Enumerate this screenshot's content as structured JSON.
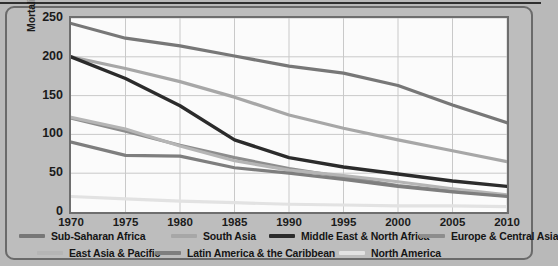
{
  "figure": {
    "background_color": "#b9b9b9",
    "panel_color": "#bdbdbd",
    "panel_border_color": "#6a6a6a",
    "plot_background_color": "#fbfbfb",
    "plot_border_color": "#6e6e6e",
    "gridline_color": "#c9c9c9"
  },
  "chart_data": {
    "type": "line",
    "title": "",
    "xlabel": "",
    "ylabel": "Mortality Rate (per 1,000 live births)",
    "x": [
      1970,
      1975,
      1980,
      1985,
      1990,
      1995,
      2000,
      2005,
      2010
    ],
    "xtick_labels": [
      "1970",
      "1975",
      "1980",
      "1985",
      "1990",
      "1995",
      "2000",
      "2005",
      "2010"
    ],
    "ytick_labels": [
      "0",
      "50",
      "100",
      "150",
      "200",
      "250"
    ],
    "yticks": [
      0,
      50,
      100,
      150,
      200,
      250
    ],
    "xlim": [
      1970,
      2010
    ],
    "ylim": [
      0,
      250
    ],
    "grid": true,
    "legend_position": "bottom",
    "series": [
      {
        "name": "Sub-Saharan Africa",
        "color": "#777777",
        "width": 3.2,
        "values": [
          243,
          224,
          214,
          201,
          188,
          179,
          163,
          138,
          115
        ]
      },
      {
        "name": "South Asia",
        "color": "#a7a7a7",
        "width": 3.2,
        "values": [
          200,
          185,
          168,
          148,
          125,
          108,
          93,
          79,
          65
        ]
      },
      {
        "name": "Middle East & North Africa",
        "color": "#2b2b2b",
        "width": 3.4,
        "values": [
          200,
          172,
          137,
          93,
          70,
          58,
          49,
          40,
          33
        ]
      },
      {
        "name": "Europe & Central Asia",
        "color": "#8d8d8d",
        "width": 3.2,
        "values": [
          121,
          104,
          86,
          70,
          56,
          45,
          34,
          27,
          21
        ]
      },
      {
        "name": "East Asia & Pacific",
        "color": "#b5b5b5",
        "width": 3.2,
        "values": [
          122,
          107,
          85,
          66,
          54,
          47,
          39,
          30,
          22
        ]
      },
      {
        "name": "Latin America & the Caribbean",
        "color": "#7e7e7e",
        "width": 3.2,
        "values": [
          90,
          73,
          72,
          57,
          50,
          42,
          33,
          26,
          20
        ]
      },
      {
        "name": "North America",
        "color": "#e2e2e2",
        "width": 3.2,
        "values": [
          20,
          17,
          14,
          12,
          10,
          9,
          8,
          8,
          7
        ]
      }
    ]
  },
  "legend": {
    "rows": [
      [
        {
          "label": "Sub-Saharan Africa",
          "color": "#777777",
          "x": 0
        },
        {
          "label": "South Asia",
          "color": "#a7a7a7",
          "x": 152
        },
        {
          "label": "Middle East & North Africa",
          "color": "#2b2b2b",
          "x": 250
        },
        {
          "label": "Europe & Central Asia",
          "color": "#8d8d8d",
          "x": 400
        }
      ],
      [
        {
          "label": "East Asia & Pacific",
          "color": "#b5b5b5",
          "x": 18
        },
        {
          "label": "Latin America & the Caribbean",
          "color": "#7e7e7e",
          "x": 136
        },
        {
          "label": "North America",
          "color": "#e2e2e2",
          "x": 320
        }
      ]
    ]
  }
}
